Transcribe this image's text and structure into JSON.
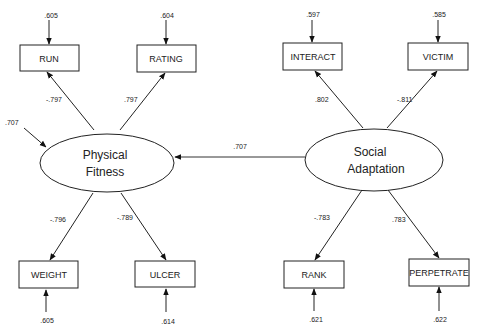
{
  "diagram": {
    "type": "structural-equation-model",
    "latents": [
      {
        "id": "physical",
        "line1": "Physical",
        "line2": "Fitness",
        "disturbance": ".707"
      },
      {
        "id": "social",
        "line1": "Social",
        "line2": "Adaptation"
      }
    ],
    "structural_path": {
      "from": "social",
      "to": "physical",
      "coef": ".707"
    },
    "indicators": [
      {
        "name": "RUN",
        "loading": "-.797",
        "error": ".605"
      },
      {
        "name": "RATING",
        "loading": ".797",
        "error": ".604"
      },
      {
        "name": "WEIGHT",
        "loading": "-.796",
        "error": ".605"
      },
      {
        "name": "ULCER",
        "loading": "-.789",
        "error": ".614"
      },
      {
        "name": "INTERACT",
        "loading": ".802",
        "error": ".597"
      },
      {
        "name": "VICTIM",
        "loading": "-.811",
        "error": ".585"
      },
      {
        "name": "RANK",
        "loading": "-.783",
        "error": ".621"
      },
      {
        "name": "PERPETRATE",
        "loading": ".783",
        "error": ".622"
      }
    ]
  }
}
